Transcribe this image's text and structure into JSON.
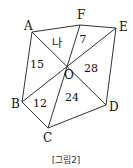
{
  "figure": {
    "caption": "[그림2]",
    "stroke_color": "#333333",
    "center": {
      "label": "O",
      "x": 66,
      "y": 66
    },
    "vertices": [
      {
        "label": "A",
        "x": 32,
        "y": 32,
        "lx": 24,
        "ly": 30
      },
      {
        "label": "F",
        "x": 80,
        "y": 25,
        "lx": 77,
        "ly": 19
      },
      {
        "label": "E",
        "x": 116,
        "y": 28,
        "lx": 119,
        "ly": 31
      },
      {
        "label": "D",
        "x": 106,
        "y": 105,
        "lx": 109,
        "ly": 111
      },
      {
        "label": "C",
        "x": 48,
        "y": 128,
        "lx": 43,
        "ly": 142
      },
      {
        "label": "B",
        "x": 22,
        "y": 102,
        "lx": 11,
        "ly": 108
      }
    ],
    "outline": [
      "A",
      "F",
      "E",
      "D",
      "C",
      "B"
    ],
    "diagonals": [
      [
        "A",
        "D"
      ],
      [
        "F",
        "C"
      ],
      [
        "E",
        "B"
      ]
    ],
    "regions": [
      {
        "triangle": "AOF",
        "text": "나",
        "x": 57,
        "y": 47
      },
      {
        "triangle": "FOE",
        "text": "7",
        "x": 83,
        "y": 43
      },
      {
        "triangle": "EOD",
        "text": "28",
        "x": 91,
        "y": 72
      },
      {
        "triangle": "DOC",
        "text": "24",
        "x": 72,
        "y": 101
      },
      {
        "triangle": "COB",
        "text": "12",
        "x": 40,
        "y": 107
      },
      {
        "triangle": "BOA",
        "text": "15",
        "x": 37,
        "y": 68
      }
    ]
  }
}
